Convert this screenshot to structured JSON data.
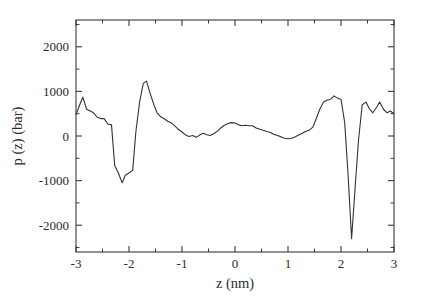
{
  "chart_data": {
    "type": "line",
    "title": "",
    "xlabel": "z (nm)",
    "ylabel": "p (z) (bar)",
    "xlim": [
      -3,
      3
    ],
    "ylim": [
      -2600,
      2600
    ],
    "xticks": [
      -3,
      -2,
      -1,
      0,
      1,
      2,
      3
    ],
    "xtick_labels": [
      "-3",
      "-2",
      "-1",
      "0",
      "1",
      "2",
      "3"
    ],
    "yticks": [
      -2000,
      -1000,
      0,
      1000,
      2000
    ],
    "ytick_labels": [
      "-2000",
      "-1000",
      "0",
      "1000",
      "2000"
    ],
    "xminor_step": 0.5,
    "yminor_step": 500,
    "grid": false,
    "legend": false,
    "line_color": "#333333",
    "series": [
      {
        "name": "p(z)",
        "x": [
          -3.0,
          -2.93,
          -2.87,
          -2.8,
          -2.73,
          -2.67,
          -2.6,
          -2.53,
          -2.47,
          -2.4,
          -2.33,
          -2.27,
          -2.2,
          -2.13,
          -2.07,
          -2.0,
          -1.93,
          -1.87,
          -1.8,
          -1.73,
          -1.67,
          -1.6,
          -1.53,
          -1.47,
          -1.4,
          -1.33,
          -1.27,
          -1.2,
          -1.13,
          -1.07,
          -1.0,
          -0.93,
          -0.87,
          -0.8,
          -0.73,
          -0.67,
          -0.6,
          -0.53,
          -0.47,
          -0.4,
          -0.33,
          -0.27,
          -0.2,
          -0.13,
          -0.07,
          0.0,
          0.07,
          0.13,
          0.2,
          0.27,
          0.33,
          0.4,
          0.47,
          0.53,
          0.6,
          0.67,
          0.73,
          0.8,
          0.87,
          0.93,
          1.0,
          1.07,
          1.13,
          1.2,
          1.27,
          1.33,
          1.4,
          1.47,
          1.53,
          1.6,
          1.67,
          1.73,
          1.8,
          1.87,
          1.93,
          2.0,
          2.07,
          2.13,
          2.2,
          2.27,
          2.33,
          2.4,
          2.47,
          2.53,
          2.6,
          2.67,
          2.73,
          2.8,
          2.87,
          2.93,
          3.0
        ],
        "y": [
          480,
          700,
          870,
          600,
          560,
          520,
          420,
          390,
          390,
          270,
          250,
          -660,
          -830,
          -1050,
          -880,
          -830,
          -770,
          100,
          760,
          1180,
          1230,
          950,
          700,
          520,
          430,
          380,
          330,
          290,
          220,
          150,
          90,
          20,
          -10,
          10,
          -30,
          20,
          60,
          30,
          10,
          50,
          110,
          180,
          240,
          280,
          300,
          290,
          250,
          230,
          240,
          230,
          230,
          180,
          150,
          130,
          100,
          80,
          40,
          10,
          -20,
          -50,
          -60,
          -50,
          -20,
          20,
          60,
          100,
          130,
          200,
          380,
          600,
          760,
          800,
          820,
          900,
          850,
          820,
          300,
          -800,
          -2300,
          -1100,
          -100,
          700,
          760,
          620,
          520,
          640,
          760,
          600,
          520,
          560,
          500
        ]
      }
    ]
  },
  "axes": {
    "frame": {
      "left_px": 76,
      "right_px": 394,
      "top_px": 20,
      "bottom_px": 252
    }
  }
}
